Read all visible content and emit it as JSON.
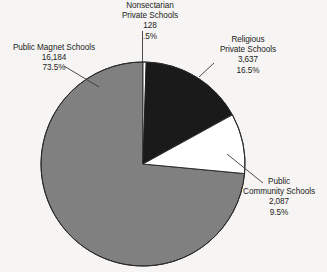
{
  "chart_data": {
    "type": "pie",
    "title": "",
    "subtitle": "",
    "xlabel": "",
    "ylabel": "",
    "legend_position": "none",
    "grid": false,
    "total": 22036,
    "start_angle_deg": 0,
    "direction": "clockwise",
    "categories": [
      "Nonsectarian Private Schools",
      "Religious Private Schools",
      "Public Community Schools",
      "Public Magnet Schools"
    ],
    "values": [
      128,
      3637,
      2087,
      16184
    ],
    "percents": [
      0.5,
      16.5,
      9.5,
      73.5
    ],
    "slices": [
      {
        "name": "Nonsectarian Private Schools",
        "value": 128,
        "value_label": "128",
        "percent": 0.5,
        "percent_label": ".5%",
        "color": "#ffffff",
        "start_deg": 0,
        "end_deg": 1.8
      },
      {
        "name": "Religious Private Schools",
        "value": 3637,
        "value_label": "3,637",
        "percent": 16.5,
        "percent_label": "16.5%",
        "color": "#1a1a1a",
        "start_deg": 1.8,
        "end_deg": 61.2
      },
      {
        "name": "Public Community Schools",
        "value": 2087,
        "value_label": "2,087",
        "percent": 9.5,
        "percent_label": "9.5%",
        "color": "#ffffff",
        "start_deg": 61.2,
        "end_deg": 95.4
      },
      {
        "name": "Public Magnet Schools",
        "value": 16184,
        "value_label": "16,184",
        "percent": 73.5,
        "percent_label": "73.5%",
        "color": "#808080",
        "start_deg": 95.4,
        "end_deg": 360
      }
    ]
  },
  "labels": {
    "nonsectarian": {
      "line1": "Nonsectarian",
      "line2": "Private Schools",
      "value": "128",
      "percent": ".5%"
    },
    "religious": {
      "line1": "Religious",
      "line2": "Private Schools",
      "value": "3,637",
      "percent": "16.5%"
    },
    "magnet": {
      "line1": "Public Magnet Schools",
      "value": "16,184",
      "percent": "73.5%"
    },
    "community": {
      "line1": "Public",
      "line2": "Community Schools",
      "value": "2,087",
      "percent": "9.5%"
    }
  },
  "colors": {
    "background": "#f6f5f3",
    "gray_slice": "#808080",
    "black_slice": "#1a1a1a",
    "white_slice": "#ffffff",
    "outline": "#2b2b2b",
    "text": "#1b1b1b"
  }
}
